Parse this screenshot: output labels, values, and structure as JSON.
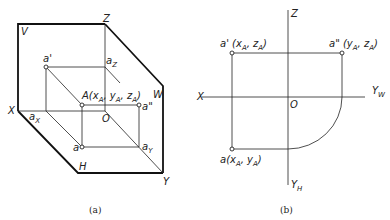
{
  "diagram_a": {
    "caption": "(a)",
    "labels": {
      "V": "V",
      "Z": "Z",
      "X": "X",
      "H": "H",
      "W": "W",
      "Y": "Y",
      "O": "O",
      "a_prime": "a'",
      "a_double_prime": "a\"",
      "a": "a",
      "a_Z_main": "a",
      "a_Z_sub": "Z",
      "a_X_main": "a",
      "a_X_sub": "X",
      "a_Y_main": "a",
      "a_Y_sub": "Y",
      "A_point": {
        "prefix": "A(x",
        "sub1": "A",
        "mid1": ", y",
        "sub2": "A",
        "mid2": ", z",
        "sub3": "A",
        "suffix": ")"
      }
    }
  },
  "diagram_b": {
    "caption": "(b)",
    "labels": {
      "Z": "Z",
      "X": "X",
      "O": "O",
      "Y_W_main": "Y",
      "Y_W_sub": "W",
      "Y_H_main": "Y",
      "Y_H_sub": "H",
      "a_prime": {
        "prefix": "a' (x",
        "sub1": "A",
        "mid": ", z",
        "sub2": "A",
        "suffix": ")"
      },
      "a_double_prime": {
        "prefix": "a\" (y",
        "sub1": "A",
        "mid": ", z",
        "sub2": "A",
        "suffix": ")"
      },
      "a": {
        "prefix": "a(x",
        "sub1": "A",
        "mid": ", y",
        "sub2": "A",
        "suffix": ")"
      }
    }
  }
}
